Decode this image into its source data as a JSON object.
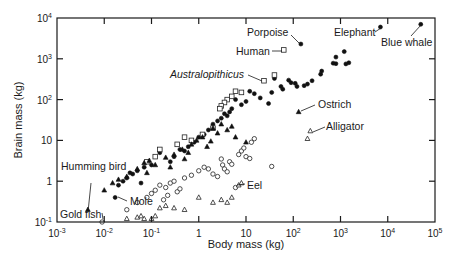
{
  "chart_data": {
    "type": "scatter",
    "title": "",
    "xlabel": "Body mass (kg)",
    "ylabel": "Brain mass (kg)",
    "xscale": "log",
    "yscale": "log",
    "xlim": [
      0.001,
      100000
    ],
    "ylim": [
      0.1,
      10000
    ],
    "grid": false,
    "legend": "none",
    "x_ticks": [
      {
        "value": 0.001,
        "base": "10",
        "exp": "-3"
      },
      {
        "value": 0.01,
        "base": "10",
        "exp": "-2"
      },
      {
        "value": 0.1,
        "base": "10",
        "exp": "-1"
      },
      {
        "value": 1,
        "base": "1",
        "exp": ""
      },
      {
        "value": 10,
        "base": "10",
        "exp": ""
      },
      {
        "value": 100,
        "base": "10",
        "exp": "2"
      },
      {
        "value": 1000,
        "base": "10",
        "exp": "3"
      },
      {
        "value": 10000,
        "base": "10",
        "exp": "4"
      },
      {
        "value": 100000,
        "base": "10",
        "exp": "5"
      }
    ],
    "y_ticks": [
      {
        "value": 0.1,
        "base": "10",
        "exp": "-1"
      },
      {
        "value": 1,
        "base": "1",
        "exp": ""
      },
      {
        "value": 10,
        "base": "10",
        "exp": ""
      },
      {
        "value": 100,
        "base": "10",
        "exp": "2"
      },
      {
        "value": 1000,
        "base": "10",
        "exp": "3"
      },
      {
        "value": 10000,
        "base": "10",
        "exp": "4"
      }
    ],
    "series": [
      {
        "name": "Mammals",
        "marker": "filled-circle",
        "points": [
          [
            50000,
            7000
          ],
          [
            7000,
            6000
          ],
          [
            145,
            2300
          ],
          [
            1200,
            1500
          ],
          [
            800,
            1100
          ],
          [
            1500,
            800
          ],
          [
            1300,
            750
          ],
          [
            800,
            760
          ],
          [
            700,
            780
          ],
          [
            400,
            500
          ],
          [
            380,
            420
          ],
          [
            250,
            290
          ],
          [
            200,
            240
          ],
          [
            170,
            220
          ],
          [
            120,
            210
          ],
          [
            110,
            250
          ],
          [
            90,
            260
          ],
          [
            80,
            300
          ],
          [
            60,
            180
          ],
          [
            55,
            210
          ],
          [
            40,
            330
          ],
          [
            35,
            150
          ],
          [
            30,
            80
          ],
          [
            20,
            110
          ],
          [
            15,
            140
          ],
          [
            12,
            160
          ],
          [
            10,
            90
          ],
          [
            8,
            75
          ],
          [
            6,
            100
          ],
          [
            5,
            60
          ],
          [
            4.5,
            50
          ],
          [
            4,
            40
          ],
          [
            3.5,
            45
          ],
          [
            3,
            35
          ],
          [
            2.5,
            30
          ],
          [
            2,
            25
          ],
          [
            1.6,
            18
          ],
          [
            1.3,
            14
          ],
          [
            1.0,
            12
          ],
          [
            0.8,
            9
          ],
          [
            0.6,
            7
          ],
          [
            0.5,
            5.5
          ],
          [
            0.4,
            6
          ],
          [
            0.3,
            4
          ],
          [
            0.25,
            3
          ],
          [
            0.15,
            5
          ],
          [
            0.1,
            2.5
          ],
          [
            0.07,
            2.2
          ],
          [
            0.05,
            1.8
          ],
          [
            0.04,
            1.5
          ],
          [
            0.03,
            1.2
          ],
          [
            0.025,
            1.0
          ],
          [
            0.02,
            0.8
          ],
          [
            0.017,
            0.4
          ],
          [
            0.06,
            0.9
          ],
          [
            0.035,
            1.6
          ]
        ]
      },
      {
        "name": "Primates / hominids",
        "marker": "open-square",
        "points": [
          [
            63,
            1650
          ],
          [
            24,
            290
          ],
          [
            40,
            400
          ],
          [
            8,
            150
          ],
          [
            6,
            160
          ],
          [
            5,
            120
          ],
          [
            4,
            100
          ],
          [
            3.5,
            85
          ],
          [
            3,
            70
          ],
          [
            2.8,
            60
          ],
          [
            2,
            20
          ],
          [
            0.7,
            10
          ],
          [
            0.5,
            12
          ],
          [
            0.15,
            6
          ],
          [
            0.12,
            4
          ],
          [
            0.08,
            3
          ],
          [
            0.35,
            8
          ],
          [
            1.2,
            14
          ]
        ]
      },
      {
        "name": "Birds",
        "marker": "filled-triangle",
        "points": [
          [
            130,
            50
          ],
          [
            0.0045,
            0.2
          ],
          [
            0.01,
            0.6
          ],
          [
            0.015,
            0.9
          ],
          [
            0.02,
            1.1
          ],
          [
            0.03,
            1.3
          ],
          [
            0.05,
            2.0
          ],
          [
            0.07,
            2.8
          ],
          [
            0.09,
            3.2
          ],
          [
            0.12,
            2.5
          ],
          [
            0.2,
            3.8
          ],
          [
            0.3,
            4.5
          ],
          [
            0.45,
            6
          ],
          [
            0.5,
            3.5
          ],
          [
            0.7,
            8
          ],
          [
            0.9,
            10
          ],
          [
            1.2,
            12
          ],
          [
            1.5,
            7
          ],
          [
            2,
            20
          ],
          [
            2.5,
            15
          ],
          [
            3,
            25
          ],
          [
            4,
            18
          ],
          [
            5,
            22
          ],
          [
            6,
            12
          ],
          [
            10,
            9
          ],
          [
            0.25,
            2.2
          ],
          [
            0.08,
            1.6
          ],
          [
            0.6,
            5
          ],
          [
            1.8,
            9.5
          ]
        ]
      },
      {
        "name": "Fishes",
        "marker": "open-circle",
        "points": [
          [
            0.009,
            0.1
          ],
          [
            0.03,
            0.2
          ],
          [
            0.05,
            0.3
          ],
          [
            0.08,
            0.4
          ],
          [
            0.1,
            0.5
          ],
          [
            0.12,
            0.6
          ],
          [
            0.15,
            0.8
          ],
          [
            0.2,
            0.7
          ],
          [
            0.25,
            0.9
          ],
          [
            0.3,
            1.0
          ],
          [
            0.35,
            0.55
          ],
          [
            0.4,
            0.65
          ],
          [
            0.5,
            1.2
          ],
          [
            0.7,
            1.4
          ],
          [
            1,
            1.8
          ],
          [
            1.3,
            2.2
          ],
          [
            1.6,
            2.0
          ],
          [
            2,
            1.5
          ],
          [
            2.5,
            1.3
          ],
          [
            3,
            3.5
          ],
          [
            3.2,
            2.5
          ],
          [
            3.5,
            2.0
          ],
          [
            4,
            1.7
          ],
          [
            4.5,
            3.0
          ],
          [
            5,
            2.6
          ],
          [
            6,
            0.7
          ],
          [
            7,
            4.5
          ],
          [
            8,
            5.5
          ],
          [
            9,
            6.5
          ],
          [
            10,
            4.0
          ],
          [
            12,
            3.6
          ],
          [
            13,
            9
          ],
          [
            15,
            11
          ],
          [
            35,
            2.3
          ],
          [
            0.18,
            0.35
          ],
          [
            0.22,
            0.45
          ]
        ]
      },
      {
        "name": "Reptiles",
        "marker": "open-triangle",
        "points": [
          [
            230,
            17
          ],
          [
            200,
            11
          ],
          [
            0.03,
            0.12
          ],
          [
            0.05,
            0.13
          ],
          [
            0.06,
            0.14
          ],
          [
            0.07,
            0.12
          ],
          [
            0.1,
            0.12
          ],
          [
            0.12,
            0.14
          ],
          [
            0.15,
            0.22
          ],
          [
            0.2,
            0.25
          ],
          [
            0.3,
            0.22
          ],
          [
            0.5,
            0.2
          ],
          [
            1.0,
            0.4
          ],
          [
            2,
            0.3
          ],
          [
            3,
            0.35
          ],
          [
            5,
            0.4
          ],
          [
            7,
            0.8
          ],
          [
            8,
            0.9
          ],
          [
            4,
            0.3
          ]
        ]
      }
    ],
    "annotations": [
      {
        "label": "Blue whale",
        "x": 50000,
        "y": 7000,
        "italic": false
      },
      {
        "label": "Elephant",
        "x": 7000,
        "y": 6000,
        "italic": false
      },
      {
        "label": "Porpoise",
        "x": 145,
        "y": 2300,
        "italic": false
      },
      {
        "label": "Human",
        "x": 63,
        "y": 1650,
        "italic": false
      },
      {
        "label": "Australopithicus",
        "x": 24,
        "y": 290,
        "italic": true
      },
      {
        "label": "Ostrich",
        "x": 130,
        "y": 50,
        "italic": false
      },
      {
        "label": "Alligator",
        "x": 230,
        "y": 17,
        "italic": false
      },
      {
        "label": "Eel",
        "x": 6,
        "y": 0.7,
        "italic": false
      },
      {
        "label": "Humming bird",
        "x": 0.0045,
        "y": 0.2,
        "italic": false
      },
      {
        "label": "Mole",
        "x": 0.017,
        "y": 0.4,
        "italic": false
      },
      {
        "label": "Gold fish",
        "x": 0.009,
        "y": 0.1,
        "italic": false
      }
    ]
  },
  "labels": {
    "xlabel": "Body mass (kg)",
    "ylabel": "Brain mass (kg)",
    "blue_whale": "Blue whale",
    "elephant": "Elephant",
    "porpoise": "Porpoise",
    "human": "Human",
    "australopithicus": "Australopithicus",
    "ostrich": "Ostrich",
    "alligator": "Alligator",
    "eel": "Eel",
    "humming_bird": "Humming bird",
    "mole": "Mole",
    "gold_fish": "Gold fish"
  }
}
